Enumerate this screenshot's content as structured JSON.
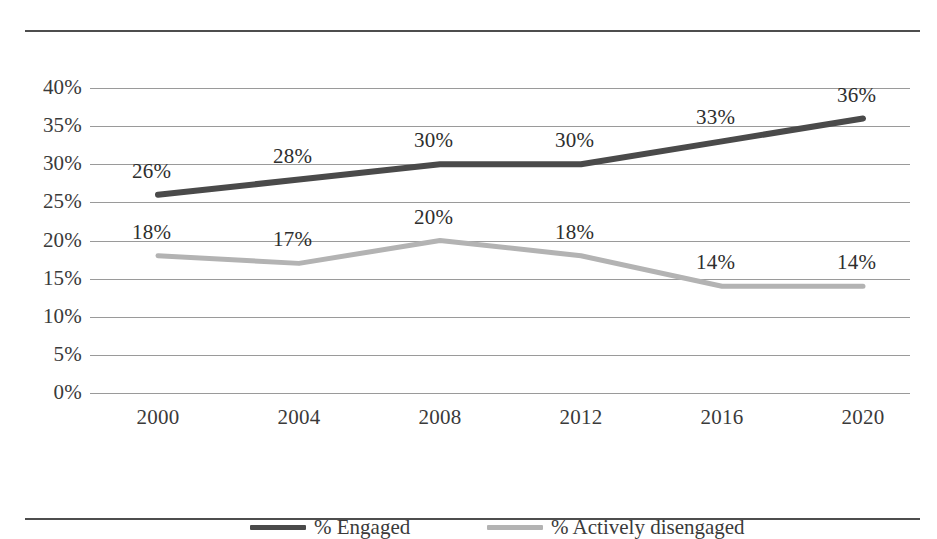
{
  "chart_data": {
    "type": "line",
    "title": "",
    "xlabel": "",
    "ylabel": "",
    "categories": [
      "2000",
      "2004",
      "2008",
      "2012",
      "2016",
      "2020"
    ],
    "ylim": [
      0,
      40
    ],
    "yticks": [
      "0%",
      "5%",
      "10%",
      "15%",
      "20%",
      "25%",
      "30%",
      "35%",
      "40%"
    ],
    "ytick_values": [
      0,
      5,
      10,
      15,
      20,
      25,
      30,
      35,
      40
    ],
    "grid": true,
    "legend_position": "bottom",
    "series": [
      {
        "name": "% Engaged",
        "color": "#4a4a4a",
        "values": [
          26,
          28,
          30,
          30,
          33,
          36
        ],
        "labels": [
          "26%",
          "28%",
          "30%",
          "30%",
          "33%",
          "36%"
        ]
      },
      {
        "name": "% Actively disengaged",
        "color": "#b3b3b3",
        "values": [
          18,
          17,
          20,
          18,
          14,
          14
        ],
        "labels": [
          "18%",
          "17%",
          "20%",
          "18%",
          "14%",
          "14%"
        ]
      }
    ]
  },
  "legend": {
    "items": [
      {
        "label": "% Engaged",
        "color": "#4a4a4a"
      },
      {
        "label": "% Actively disengaged",
        "color": "#b3b3b3"
      }
    ]
  },
  "colors": {
    "engaged": "#4a4a4a",
    "disengaged": "#b3b3b3",
    "gridline": "#9a9a9a",
    "rule": "#4d4d4d",
    "text": "#3a3a3a",
    "background": "#ffffff"
  }
}
